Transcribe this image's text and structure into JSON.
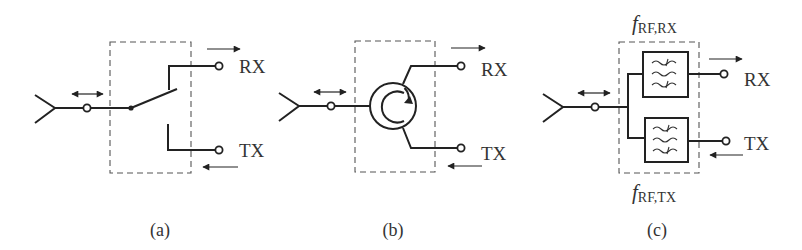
{
  "figure": {
    "panels": [
      {
        "id": "a",
        "type": "switch",
        "caption": "(a)",
        "ports": {
          "rx": "RX",
          "tx": "TX"
        }
      },
      {
        "id": "b",
        "type": "circulator",
        "caption": "(b)",
        "ports": {
          "rx": "RX",
          "tx": "TX"
        }
      },
      {
        "id": "c",
        "type": "duplexer",
        "caption": "(c)",
        "ports": {
          "rx": "RX",
          "tx": "TX"
        },
        "filters": {
          "rx": {
            "symbol": "f",
            "subscript": "RF,RX"
          },
          "tx": {
            "symbol": "f",
            "subscript": "RF,TX"
          }
        }
      }
    ]
  },
  "colors": {
    "line": "#222222",
    "dashed_box": "#555555",
    "text": "#333333",
    "background": "#ffffff"
  },
  "icons": {
    "antenna": "antenna-icon",
    "terminal": "terminal-circle-icon",
    "bidirectional_arrow": "double-arrow-icon",
    "switch": "spdt-switch-icon",
    "circulator": "circulator-icon",
    "bandpass_filter": "bandpass-filter-icon"
  }
}
